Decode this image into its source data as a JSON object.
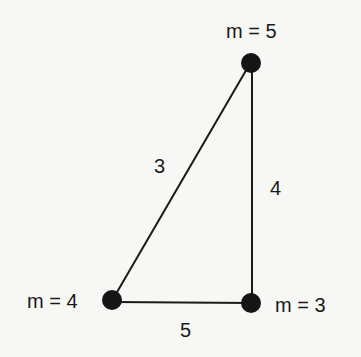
{
  "diagram": {
    "type": "weighted-graph",
    "nodes": [
      {
        "id": "top",
        "label": "m = 5",
        "x": 251,
        "y": 63
      },
      {
        "id": "bottom-left",
        "label": "m = 4",
        "x": 112,
        "y": 300
      },
      {
        "id": "bottom-right",
        "label": "m = 3",
        "x": 251,
        "y": 301
      }
    ],
    "edges": [
      {
        "from": "top",
        "to": "bottom-left",
        "label": "3"
      },
      {
        "from": "top",
        "to": "bottom-right",
        "label": "4"
      },
      {
        "from": "bottom-left",
        "to": "bottom-right",
        "label": "5"
      }
    ]
  },
  "colors": {
    "background": "#f7f7f5",
    "ink": "#1a1a1a"
  }
}
